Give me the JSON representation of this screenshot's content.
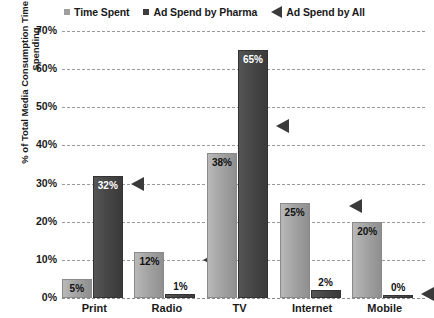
{
  "chart_data": {
    "type": "bar",
    "title": "",
    "xlabel": "",
    "ylabel": "% of Total Media Consumption Time or Advertising Spending",
    "ylim": [
      0,
      70
    ],
    "ytick_labels": [
      "70%",
      "60%",
      "50%",
      "40%",
      "30%",
      "20%",
      "10%",
      "0%"
    ],
    "ytick_values": [
      70,
      60,
      50,
      40,
      30,
      20,
      10,
      0
    ],
    "grid": true,
    "legend_position": "top",
    "categories": [
      "Print",
      "Radio",
      "TV",
      "Internet",
      "Mobile"
    ],
    "series": [
      {
        "name": "Time Spent",
        "marker": "square-light",
        "color": "#a4a4a4",
        "values": [
          5,
          12,
          38,
          25,
          20
        ],
        "labels": [
          "5%",
          "12%",
          "38%",
          "25%",
          "20%"
        ]
      },
      {
        "name": "Ad Spend by Pharma",
        "marker": "square-dark",
        "color": "#474747",
        "values": [
          32,
          1,
          65,
          2,
          0
        ],
        "labels": [
          "32%",
          "1%",
          "65%",
          "2%",
          "0%"
        ]
      },
      {
        "name": "Ad Spend by All",
        "marker": "left-triangle",
        "color": "#3a3a3a",
        "values": [
          30,
          10,
          45,
          24,
          1
        ],
        "labels": [
          "",
          "",
          "",
          "",
          ""
        ]
      }
    ]
  },
  "legend": {
    "items": [
      {
        "label": "Time Spent",
        "marker": "square-light"
      },
      {
        "label": "Ad Spend by Pharma",
        "marker": "square-dark"
      },
      {
        "label": "Ad Spend by All",
        "marker": "left-triangle"
      }
    ]
  },
  "axes": {
    "y_title": "% of Total Media Consumption Time or Advertising Spending"
  }
}
